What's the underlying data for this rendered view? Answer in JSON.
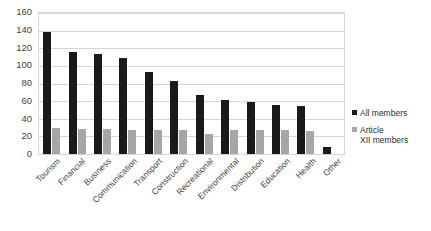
{
  "chart_data": {
    "type": "bar",
    "title": "",
    "xlabel": "",
    "ylabel": "",
    "ylim": [
      0,
      160
    ],
    "ystep": 20,
    "grid": true,
    "legend_position": "right",
    "categories": [
      "Tourism",
      "Financial",
      "Business",
      "Communication",
      "Transport",
      "Construction",
      "Recreational",
      "Environmental",
      "Distribution",
      "Education",
      "Health",
      "Other"
    ],
    "series": [
      {
        "name": "All members",
        "color": "#1a1a1a",
        "values": [
          140,
          117,
          114,
          110,
          94,
          84,
          68,
          62,
          60,
          56,
          55,
          8
        ]
      },
      {
        "name": "Article XII members",
        "color": "#a6a6a6",
        "values": [
          30,
          29,
          29,
          28,
          27,
          28,
          23,
          27,
          28,
          27,
          26,
          0
        ]
      }
    ],
    "ytick_labels": [
      "160",
      "140",
      "120",
      "100",
      "80",
      "60",
      "40",
      "20",
      "0"
    ]
  },
  "legend": {
    "items": [
      {
        "label": "All members",
        "color": "#1a1a1a"
      },
      {
        "label": "Article\n  XII members",
        "color": "#a6a6a6"
      }
    ]
  },
  "colors": {
    "series_a": "#1a1a1a",
    "series_b": "#a6a6a6",
    "gridline": "#d6d6d6",
    "text": "#3f3f3f",
    "background": "#ffffff"
  }
}
